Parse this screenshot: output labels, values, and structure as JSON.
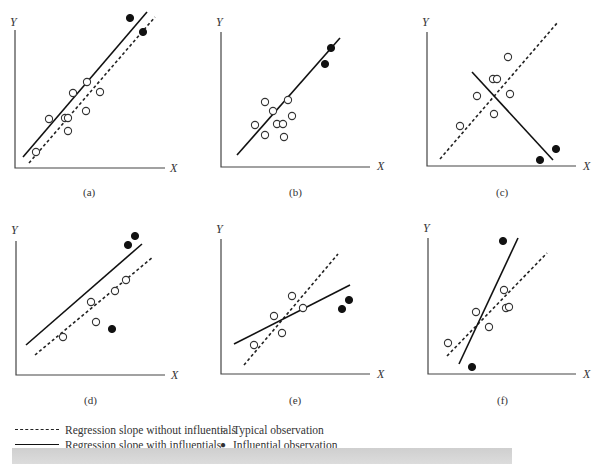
{
  "chart_data": [
    {
      "panel": "(a)",
      "type": "scatter",
      "xlabel": "X",
      "ylabel": "Y",
      "typical": [
        [
          36,
          152
        ],
        [
          49,
          119
        ],
        [
          65,
          118
        ],
        [
          68,
          118
        ],
        [
          73,
          93
        ],
        [
          68,
          131
        ],
        [
          86,
          111
        ],
        [
          87,
          82
        ],
        [
          100,
          92
        ]
      ],
      "influential": [
        [
          130,
          18
        ],
        [
          143,
          32
        ]
      ],
      "line_with": [
        [
          23,
          157
        ],
        [
          147,
          12
        ]
      ],
      "line_without": [
        [
          29,
          163
        ],
        [
          155,
          17
        ]
      ]
    },
    {
      "panel": "(b)",
      "type": "scatter",
      "xlabel": "X",
      "ylabel": "Y",
      "typical": [
        [
          265,
          102
        ],
        [
          273,
          111
        ],
        [
          255,
          125
        ],
        [
          277,
          124
        ],
        [
          283,
          124
        ],
        [
          288,
          100
        ],
        [
          292,
          116
        ],
        [
          265,
          135
        ],
        [
          284,
          137
        ]
      ],
      "influential": [
        [
          331,
          48
        ],
        [
          325,
          64
        ]
      ],
      "line_with": [
        [
          237,
          155
        ],
        [
          340,
          38
        ]
      ],
      "line_without": null
    },
    {
      "panel": "(c)",
      "type": "scatter",
      "xlabel": "X",
      "ylabel": "Y",
      "typical": [
        [
          460,
          126
        ],
        [
          477,
          96
        ],
        [
          493,
          79
        ],
        [
          497,
          79
        ],
        [
          494,
          114
        ],
        [
          508,
          57
        ],
        [
          510,
          94
        ]
      ],
      "influential": [
        [
          540,
          160
        ],
        [
          556,
          149
        ]
      ],
      "line_with": [
        [
          472,
          72
        ],
        [
          553,
          160
        ]
      ],
      "line_without": [
        [
          440,
          159
        ],
        [
          558,
          22
        ]
      ]
    },
    {
      "panel": "(d)",
      "type": "scatter",
      "xlabel": "X",
      "ylabel": "Y",
      "typical": [
        [
          63,
          337
        ],
        [
          91,
          302
        ],
        [
          96,
          322
        ],
        [
          115,
          291
        ],
        [
          126,
          280
        ]
      ],
      "influential": [
        [
          128,
          245
        ],
        [
          135,
          236
        ],
        [
          112,
          329
        ]
      ],
      "line_with": [
        [
          26,
          345
        ],
        [
          142,
          244
        ]
      ],
      "line_without": [
        [
          35,
          355
        ],
        [
          153,
          257
        ]
      ]
    },
    {
      "panel": "(e)",
      "type": "scatter",
      "xlabel": "X",
      "ylabel": "Y",
      "typical": [
        [
          254,
          345
        ],
        [
          274,
          316
        ],
        [
          292,
          296
        ],
        [
          282,
          333
        ],
        [
          303,
          308
        ]
      ],
      "influential": [
        [
          342,
          309
        ],
        [
          349,
          300
        ]
      ],
      "line_with": [
        [
          234,
          344
        ],
        [
          350,
          285
        ]
      ],
      "line_without": [
        [
          244,
          365
        ],
        [
          338,
          254
        ]
      ]
    },
    {
      "panel": "(f)",
      "type": "scatter",
      "xlabel": "X",
      "ylabel": "Y",
      "typical": [
        [
          448,
          343
        ],
        [
          476,
          312
        ],
        [
          489,
          327
        ],
        [
          504,
          290
        ],
        [
          506,
          308
        ],
        [
          509,
          307
        ]
      ],
      "influential": [
        [
          503,
          241
        ],
        [
          472,
          367
        ]
      ],
      "line_with": [
        [
          459,
          364
        ],
        [
          518,
          238
        ]
      ],
      "line_without": [
        [
          447,
          356
        ],
        [
          547,
          253
        ]
      ]
    }
  ],
  "panels": [
    {
      "label": "(a)",
      "y": "Y",
      "x": "X"
    },
    {
      "label": "(b)",
      "y": "Y",
      "x": "X"
    },
    {
      "label": "(c)",
      "y": "Y",
      "x": "X"
    },
    {
      "label": "(d)",
      "y": "Y",
      "x": "X"
    },
    {
      "label": "(e)",
      "y": "Y",
      "x": "X"
    },
    {
      "label": "(f)",
      "y": "Y",
      "x": "X"
    }
  ],
  "legend": {
    "without": "Regression slope without influentials",
    "with": "Regression slope with influentials",
    "typical": "Typical observation",
    "influential": "Influential observation",
    "typical_symbol": "○",
    "influential_symbol": "●"
  }
}
